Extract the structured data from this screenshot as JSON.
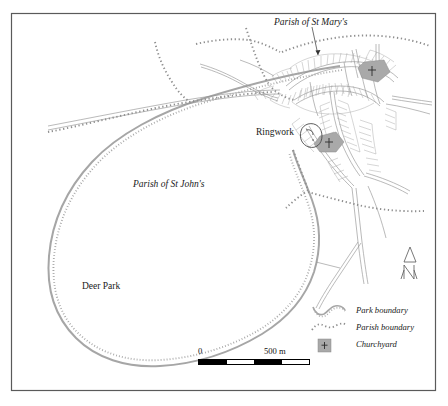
{
  "map": {
    "title_labels": {
      "parish_st_marys": "Parish of St Mary's",
      "parish_st_johns": "Parish of St John's",
      "deer_park": "Deer Park",
      "ringwork": "Ringwork"
    },
    "legend": {
      "items": [
        {
          "symbol": "park-boundary-symbol",
          "label": "Park boundary"
        },
        {
          "symbol": "parish-boundary-symbol",
          "label": "Parish boundary"
        },
        {
          "symbol": "churchyard-symbol",
          "label": "Churchyard"
        }
      ]
    },
    "scale": {
      "min_label": "0",
      "max_label": "500 m",
      "units": "m",
      "segments": 4
    },
    "north_arrow": {
      "letter": "N"
    },
    "colors": {
      "frame": "#5a5a5a",
      "park_boundary": "#9a9a9a",
      "parish_boundary": "#8f8f8f",
      "churchyard_fill": "#a9a9a9",
      "road": "#8a8a8a",
      "plot_line": "#9e9e9e",
      "text": "#1a1a1a",
      "background": "#ffffff"
    }
  }
}
